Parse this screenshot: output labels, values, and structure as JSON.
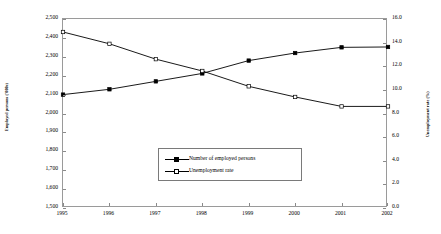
{
  "chart_data": {
    "type": "line",
    "title": "",
    "xlabel": "",
    "grid": false,
    "legend_position": "inside-bottom-center",
    "categories": [
      "1995",
      "1996",
      "1997",
      "1998",
      "1999",
      "2000",
      "2001",
      "2002"
    ],
    "axes": {
      "left": {
        "label": "Employed persons ('000s)",
        "ticks": [
          "1,500",
          "1,600",
          "1,700",
          "1,800",
          "1,900",
          "2,000",
          "2,100",
          "2,200",
          "2,300",
          "2,400",
          "2,500"
        ],
        "min": 1500,
        "max": 2500,
        "step": 100
      },
      "right": {
        "label": "Unemployment rate (%)",
        "ticks": [
          "0.0",
          "2.0",
          "4.0",
          "6.0",
          "8.0",
          "10.0",
          "12.0",
          "14.0",
          "16.0"
        ],
        "min": 0.0,
        "max": 16.0,
        "step": 2.0
      }
    },
    "series": [
      {
        "name": "Number of employed persons",
        "axis": "left",
        "marker": "filled-square",
        "values": [
          2100,
          2128,
          2170,
          2212,
          2280,
          2320,
          2350,
          2352
        ]
      },
      {
        "name": "Unemployment rate",
        "axis": "right",
        "marker": "hollow-square",
        "values": [
          14.9,
          13.9,
          12.6,
          11.6,
          10.3,
          9.4,
          8.6,
          8.6
        ]
      }
    ]
  },
  "legend": {
    "items": [
      {
        "label": "Number of employed persons",
        "marker": "filled-square"
      },
      {
        "label": "Unemployment rate",
        "marker": "hollow-square"
      }
    ]
  },
  "colors": {
    "series_line": "#000000",
    "frame": "#9a9a9a",
    "background": "#ffffff"
  }
}
